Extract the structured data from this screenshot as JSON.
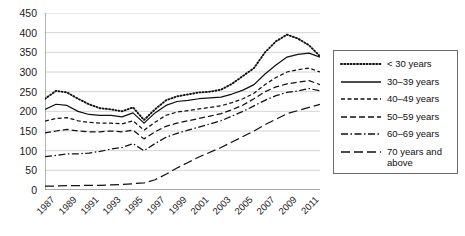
{
  "chart_data": {
    "type": "line",
    "title": "",
    "xlabel": "",
    "ylabel": "",
    "ylim": [
      0,
      450
    ],
    "ytick_step": 50,
    "grid": true,
    "legend_position": "right",
    "x": [
      1987,
      1988,
      1989,
      1990,
      1991,
      1992,
      1993,
      1994,
      1995,
      1996,
      1997,
      1998,
      1999,
      2000,
      2001,
      2002,
      2003,
      2004,
      2005,
      2006,
      2007,
      2008,
      2009,
      2010,
      2011,
      2012
    ],
    "x_tick_labels": [
      "1987",
      "1989",
      "1991",
      "1993",
      "1995",
      "1997",
      "1999",
      "2001",
      "2003",
      "2005",
      "2007",
      "2009",
      "2011"
    ],
    "y_tick_labels": [
      "0",
      "50",
      "100",
      "150",
      "200",
      "250",
      "300",
      "350",
      "400",
      "450"
    ],
    "series": [
      {
        "name": "< 30 years",
        "style": "dotted",
        "values": [
          232,
          252,
          248,
          232,
          218,
          208,
          205,
          200,
          210,
          178,
          205,
          228,
          238,
          243,
          248,
          250,
          255,
          270,
          290,
          310,
          350,
          378,
          395,
          385,
          368,
          340
        ]
      },
      {
        "name": "30–39 years",
        "style": "solid",
        "values": [
          205,
          218,
          215,
          200,
          192,
          190,
          190,
          186,
          196,
          170,
          196,
          215,
          225,
          228,
          232,
          234,
          236,
          244,
          254,
          268,
          295,
          318,
          338,
          345,
          348,
          338
        ]
      },
      {
        "name": "40–49 years",
        "style": "short-dash",
        "values": [
          175,
          182,
          184,
          176,
          172,
          170,
          170,
          168,
          176,
          152,
          172,
          190,
          198,
          202,
          206,
          210,
          214,
          222,
          232,
          246,
          268,
          286,
          300,
          306,
          310,
          300
        ]
      },
      {
        "name": "50–59 years",
        "style": "medium-dash",
        "values": [
          145,
          150,
          154,
          150,
          148,
          148,
          150,
          148,
          152,
          130,
          148,
          162,
          170,
          176,
          182,
          188,
          194,
          204,
          216,
          232,
          250,
          262,
          270,
          274,
          278,
          268
        ]
      },
      {
        "name": "60–69 years",
        "style": "dash-dot",
        "values": [
          85,
          88,
          92,
          92,
          94,
          98,
          104,
          108,
          118,
          100,
          118,
          134,
          144,
          152,
          160,
          168,
          176,
          188,
          200,
          214,
          228,
          240,
          248,
          252,
          258,
          252
        ]
      },
      {
        "name": "70 years and above",
        "style": "long-dash",
        "values": [
          10,
          10,
          11,
          11,
          12,
          12,
          13,
          14,
          16,
          18,
          26,
          40,
          56,
          70,
          84,
          96,
          108,
          122,
          136,
          150,
          166,
          180,
          194,
          202,
          210,
          218
        ]
      }
    ]
  },
  "legend": {
    "items": [
      {
        "label": "< 30 years"
      },
      {
        "label": "30–39 years"
      },
      {
        "label": "40–49 years"
      },
      {
        "label": "50–59 years"
      },
      {
        "label": "60–69 years"
      },
      {
        "label": "70 years and above"
      }
    ]
  },
  "colors": {
    "line": "#111111",
    "grid": "#c9c9c9",
    "axis": "#6b6b6b",
    "legend_border": "#6b6b6b",
    "background": "#ffffff"
  }
}
